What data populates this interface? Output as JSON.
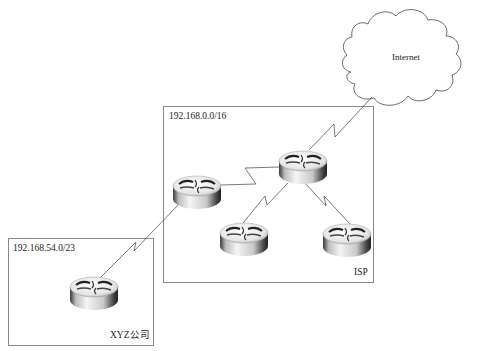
{
  "diagram": {
    "title": "",
    "cloud": {
      "label": "Internet",
      "icon": "cloud-icon"
    },
    "regions": [
      {
        "id": "isp",
        "network": "192.168.0.0/16",
        "name": "ISP"
      },
      {
        "id": "xyz",
        "network": "192.168.54.0/23",
        "name": "XYZ公司"
      }
    ],
    "routers": [
      {
        "id": "isp-core",
        "icon": "router-icon",
        "region": "isp"
      },
      {
        "id": "isp-edge-left",
        "icon": "router-icon",
        "region": "isp"
      },
      {
        "id": "isp-bottom-left",
        "icon": "router-icon",
        "region": "isp"
      },
      {
        "id": "isp-bottom-right",
        "icon": "router-icon",
        "region": "isp"
      },
      {
        "id": "xyz-router",
        "icon": "router-icon",
        "region": "xyz"
      }
    ],
    "links": [
      {
        "from": "internet",
        "to": "isp-core",
        "type": "serial"
      },
      {
        "from": "isp-edge-left",
        "to": "isp-core",
        "type": "serial"
      },
      {
        "from": "isp-core",
        "to": "isp-bottom-left",
        "type": "serial"
      },
      {
        "from": "isp-core",
        "to": "isp-bottom-right",
        "type": "serial"
      },
      {
        "from": "xyz-router",
        "to": "isp-edge-left",
        "type": "serial"
      }
    ]
  },
  "colors": {
    "line": "#555555",
    "border": "#8a8a8a",
    "router_light": "#f2f2f2",
    "router_dark": "#2a2a2a"
  }
}
